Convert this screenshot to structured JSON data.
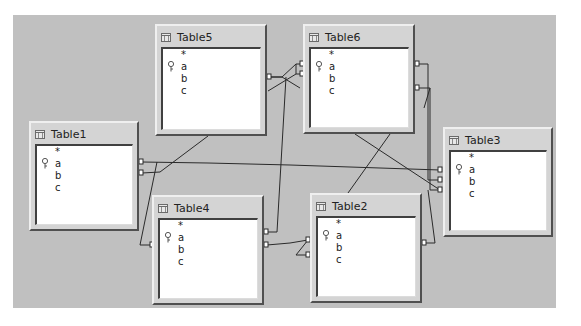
{
  "diagram": {
    "background_color": "#c0c0c0",
    "tables": [
      {
        "id": "table5",
        "name": "Table5",
        "columns": [
          "*",
          "a",
          "b",
          "c"
        ],
        "primary_key": "a",
        "x": 155,
        "y": 24,
        "w": 112,
        "h": 112
      },
      {
        "id": "table6",
        "name": "Table6",
        "columns": [
          "*",
          "a",
          "b",
          "c"
        ],
        "primary_key": "a",
        "x": 303,
        "y": 24,
        "w": 112,
        "h": 110
      },
      {
        "id": "table1",
        "name": "Table1",
        "columns": [
          "*",
          "a",
          "b",
          "c"
        ],
        "primary_key": "a",
        "x": 29,
        "y": 121,
        "w": 110,
        "h": 110
      },
      {
        "id": "table3",
        "name": "Table3",
        "columns": [
          "*",
          "a",
          "b",
          "c"
        ],
        "primary_key": "a",
        "x": 443,
        "y": 127,
        "w": 110,
        "h": 110
      },
      {
        "id": "table4",
        "name": "Table4",
        "columns": [
          "*",
          "a",
          "b",
          "c"
        ],
        "primary_key": "a",
        "x": 152,
        "y": 195,
        "w": 112,
        "h": 110
      },
      {
        "id": "table2",
        "name": "Table2",
        "columns": [
          "*",
          "a",
          "b",
          "c"
        ],
        "primary_key": "a",
        "x": 310,
        "y": 193,
        "w": 112,
        "h": 110
      }
    ],
    "relationships": [
      {
        "from": "Table5",
        "to": "Table6"
      },
      {
        "from": "Table5",
        "to": "Table1"
      },
      {
        "from": "Table6",
        "to": "Table3"
      },
      {
        "from": "Table6",
        "to": "Table2"
      },
      {
        "from": "Table1",
        "to": "Table3"
      },
      {
        "from": "Table1",
        "to": "Table4"
      },
      {
        "from": "Table4",
        "to": "Table6"
      },
      {
        "from": "Table4",
        "to": "Table2"
      },
      {
        "from": "Table2",
        "to": "Table3"
      }
    ]
  }
}
